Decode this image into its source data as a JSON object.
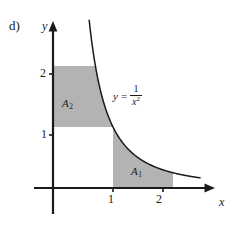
{
  "figure": {
    "part_label": "d)",
    "background_color": "#ffffff",
    "ink_color": "#1a1a1a",
    "shade_color": "#b3b3b3"
  },
  "chart_data": {
    "type": "line",
    "title": "",
    "subtitle": "",
    "xlabel": "x",
    "ylabel": "y",
    "function_label": {
      "lhs": "y",
      "equals": "=",
      "numerator": "1",
      "denominator": "x",
      "exponent": "2",
      "plain": "y = 1/x^2"
    },
    "curve": {
      "name": "y = 1/x^2",
      "expression": "1/x^2",
      "x": [
        0.4,
        0.45,
        0.5,
        0.6,
        0.7,
        0.8,
        0.9,
        1.0,
        1.1,
        1.2,
        1.3,
        1.4,
        1.5,
        1.6,
        1.7,
        1.8,
        1.9,
        2.0,
        2.1,
        2.2,
        2.3,
        2.4
      ],
      "y": [
        6.25,
        4.94,
        4.0,
        2.78,
        2.04,
        1.56,
        1.23,
        1.0,
        0.83,
        0.69,
        0.59,
        0.51,
        0.44,
        0.39,
        0.35,
        0.31,
        0.28,
        0.25,
        0.23,
        0.21,
        0.19,
        0.17
      ]
    },
    "xlim": [
      0,
      2.6
    ],
    "ylim": [
      0,
      2.75
    ],
    "xticks": [
      1,
      2
    ],
    "xtick_labels": [
      "1",
      "2"
    ],
    "yticks": [
      1,
      2
    ],
    "ytick_labels": [
      "1",
      "2"
    ],
    "grid": false,
    "legend": "none",
    "axes_style": "arrows",
    "shaded_regions": [
      {
        "id": "A1",
        "label": "A",
        "subscript": "1",
        "description": "Region under y = 1/x^2 from x = 1 to x = 2, above the x-axis.",
        "x_from": 1,
        "x_to": 2,
        "y_from": 0,
        "y_to": "1/x^2",
        "fill": "#b3b3b3"
      },
      {
        "id": "A2",
        "label": "A",
        "subscript": "2",
        "description": "Region left of the curve x = 1/sqrt(y) from y = 1 to y = 2, right of the y-axis.",
        "y_from": 1,
        "y_to": 2,
        "x_from": 0,
        "x_to": "1/sqrt(y)",
        "fill": "#b3b3b3"
      }
    ]
  }
}
